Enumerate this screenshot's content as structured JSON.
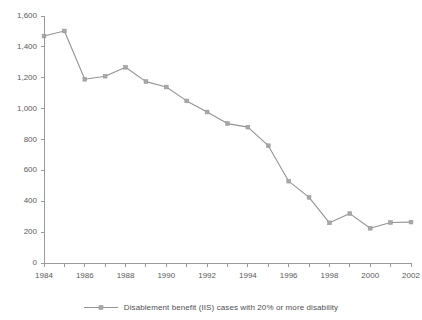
{
  "chart_data": {
    "type": "line",
    "title": "",
    "xlabel": "",
    "ylabel": "",
    "grid": false,
    "legend_position": "bottom-center",
    "x": [
      1984,
      1985,
      1986,
      1987,
      1988,
      1989,
      1990,
      1991,
      1992,
      1993,
      1994,
      1995,
      1996,
      1997,
      1998,
      1999,
      2000,
      2001,
      2002
    ],
    "series": [
      {
        "name": "Disablement benefit (IIS) cases with 20% or more disability",
        "color": "#949494",
        "marker": "square",
        "values": [
          1470,
          1503,
          1190,
          1210,
          1268,
          1175,
          1140,
          1050,
          978,
          903,
          880,
          760,
          530,
          425,
          260,
          320,
          225,
          262,
          265
        ]
      }
    ],
    "xlim": [
      1984,
      2002
    ],
    "ylim": [
      0,
      1600
    ],
    "ytick_values": [
      0,
      200,
      400,
      600,
      800,
      1000,
      1200,
      1400,
      1600
    ],
    "ytick_labels": [
      "0",
      "200",
      "400",
      "600",
      "800",
      "1,000",
      "1,200",
      "1,400",
      "1,600"
    ],
    "xtick_values": [
      1984,
      1985,
      1986,
      1987,
      1988,
      1989,
      1990,
      1991,
      1992,
      1993,
      1994,
      1995,
      1996,
      1997,
      1998,
      1999,
      2000,
      2001,
      2002
    ],
    "xtick_labels": [
      "1984",
      "",
      "1986",
      "",
      "1988",
      "",
      "1990",
      "",
      "1992",
      "",
      "1994",
      "",
      "1996",
      "",
      "1998",
      "",
      "2000",
      "",
      "2002"
    ]
  },
  "legend": {
    "label": "Disablement benefit (IIS) cases with 20% or more disability",
    "color": "#949494"
  },
  "colors": {
    "series": "#949494",
    "axis": "#9a9a9a",
    "text": "#5a5a5a",
    "background": "#ffffff"
  }
}
